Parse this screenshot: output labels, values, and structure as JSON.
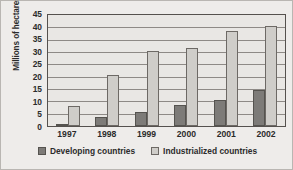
{
  "chart_data": {
    "type": "bar",
    "title": "",
    "subtitle": "",
    "xlabel": "",
    "ylabel": "Millions of hectares",
    "categories": [
      "1997",
      "1998",
      "1999",
      "2000",
      "2001",
      "2002"
    ],
    "series": [
      {
        "name": "Developing countries",
        "color": "#7d7b78",
        "values": [
          1,
          3.5,
          5.5,
          8.5,
          10.5,
          14.5
        ]
      },
      {
        "name": "Industrialized countries",
        "color": "#cfcdc9",
        "values": [
          8,
          20.5,
          30.5,
          31.5,
          38.5,
          40.5
        ]
      }
    ],
    "ylim": [
      0,
      45
    ],
    "ytick_step": 5,
    "yticks": [
      "0",
      "5",
      "10",
      "15",
      "20",
      "25",
      "30",
      "35",
      "40",
      "45"
    ],
    "grid": true,
    "grid_axis": "y",
    "legend_position": "bottom",
    "bar_group_mode": "grouped"
  }
}
